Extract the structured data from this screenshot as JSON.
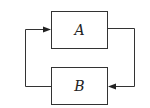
{
  "diagram": {
    "type": "feedback-loop",
    "blocks": [
      {
        "id": "A",
        "label": "A"
      },
      {
        "id": "B",
        "label": "B"
      }
    ],
    "edges": [
      {
        "from": "A",
        "to": "B",
        "route": "right side, arrow into B from right"
      },
      {
        "from": "B",
        "to": "A",
        "route": "left side, arrow into A from left"
      }
    ],
    "colors": {
      "stroke": "#333333",
      "background": "#ffffff"
    }
  }
}
